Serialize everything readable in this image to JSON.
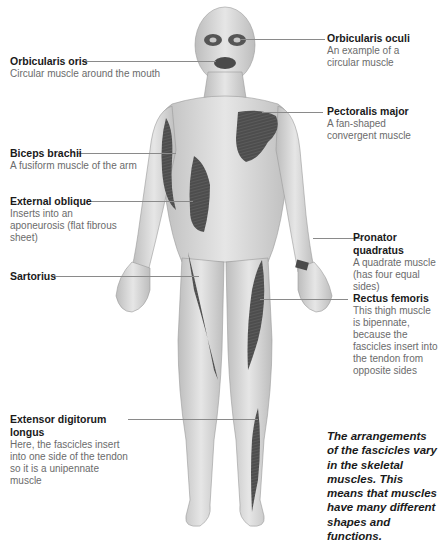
{
  "labels": {
    "orbicularis_oris": {
      "title": "Orbicularis oris",
      "desc": "Circular muscle around the mouth"
    },
    "orbicularis_oculi": {
      "title": "Orbicularis oculi",
      "desc": "An example of a circular muscle"
    },
    "pectoralis_major": {
      "title": "Pectoralis major",
      "desc": "A fan-shaped convergent muscle"
    },
    "biceps_brachii": {
      "title": "Biceps brachii",
      "desc": "A fusiform muscle of the arm"
    },
    "external_oblique": {
      "title": "External oblique",
      "desc": "Inserts into an aponeurosis (flat fibrous sheet)"
    },
    "pronator_quadratus": {
      "title": "Pronator quadratus",
      "desc": "A quadrate muscle (has four equal sides)"
    },
    "sartorius": {
      "title": "Sartorius",
      "desc": ""
    },
    "rectus_femoris": {
      "title": "Rectus femoris",
      "desc": "This thigh muscle is bipennate, because the fascicles insert into the tendon from opposite sides"
    },
    "extensor_digitorum_longus": {
      "title": "Extensor digitorum longus",
      "desc": "Here, the fascicles insert into one side of the tendon so it is a unipennate muscle"
    }
  },
  "note": "The arrangements of the fascicles vary in the skeletal muscles. This means that muscles have many different shapes and functions.",
  "colors": {
    "skin": "#d9d9d9",
    "muscle": "#4a4a4a",
    "leader": "#8a8a8a",
    "title_text": "#1a1a1a",
    "desc_text": "#6b6b6b"
  }
}
